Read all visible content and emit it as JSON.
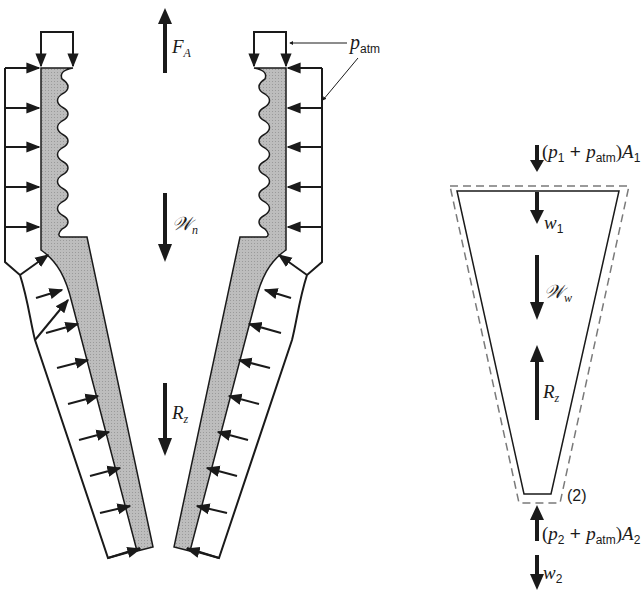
{
  "diagram": {
    "type": "free-body / control-volume diagram",
    "left_figure": {
      "name": "nozzle free-body diagram",
      "labels": {
        "force_a": {
          "symbol": "F",
          "sub": "A"
        },
        "weight_nozzle": {
          "symbol": "𝒲",
          "sub": "n"
        },
        "reaction": {
          "symbol": "R",
          "sub": "z"
        },
        "atm_pressure": {
          "symbol": "p",
          "sub": "atm"
        }
      }
    },
    "right_figure": {
      "name": "water control volume",
      "labels": {
        "inlet_force": {
          "prefix": "(",
          "p": "p",
          "p_sub": "1",
          "plus": " + ",
          "patm": "p",
          "patm_sub": "atm",
          "close": ")",
          "A": "A",
          "A_sub": "1"
        },
        "w1": {
          "symbol": "w",
          "sub": "1"
        },
        "weight_water": {
          "symbol": "𝒲",
          "sub": "w"
        },
        "reaction": {
          "symbol": "R",
          "sub": "z"
        },
        "section_label": "(2)",
        "outlet_force": {
          "prefix": "(",
          "p": "p",
          "p_sub": "2",
          "plus": " + ",
          "patm": "p",
          "patm_sub": "atm",
          "close": ")",
          "A": "A",
          "A_sub": "2"
        },
        "w2": {
          "symbol": "w",
          "sub": "2"
        }
      }
    },
    "colors": {
      "ink": "#1a1a1a",
      "wall_fill": "#b8b8b8",
      "dashed": "#7a7a7a",
      "background": "#ffffff"
    }
  }
}
